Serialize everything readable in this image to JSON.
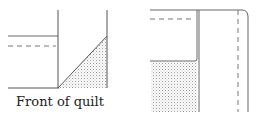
{
  "figures": [
    {
      "id": "front",
      "caption": "Front of quilt",
      "shading": "dotted"
    },
    {
      "id": "back",
      "caption": "",
      "shading": "dotted"
    }
  ],
  "colors": {
    "line": "#555555",
    "dash": "#777777",
    "fill_dot": "#9a9a9a"
  }
}
